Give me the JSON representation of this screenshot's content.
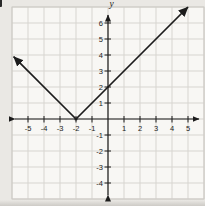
{
  "chart_data": {
    "type": "line",
    "title": "",
    "function": "y = |x + 2|",
    "series": [
      {
        "name": "absolute-value-graph",
        "points": [
          [
            -5.9,
            3.9
          ],
          [
            -2,
            0
          ],
          [
            5,
            7
          ]
        ],
        "arrows": "both",
        "color": "#1c1c1c"
      }
    ],
    "key_points": {
      "vertex": [
        -2,
        0
      ],
      "y_intercept": [
        0,
        2
      ]
    },
    "xlabel": "",
    "ylabel": "y",
    "x_ticks": [
      -5,
      -4,
      -3,
      -2,
      -1,
      1,
      2,
      3,
      4,
      5
    ],
    "y_ticks": [
      -4,
      -3,
      -2,
      -1,
      1,
      2,
      3,
      4,
      5,
      6
    ],
    "xlim": [
      -6,
      6
    ],
    "ylim": [
      -5,
      7
    ],
    "grid": true,
    "legend": "none"
  },
  "colors": {
    "axis": "#1c1c1c",
    "grid_line": "#d7d5d0",
    "grid_border": "#ccc9c4",
    "plot_bg": "#f8f7f4",
    "page_bg": "#eae8e4",
    "label": "#1b1b1b"
  }
}
